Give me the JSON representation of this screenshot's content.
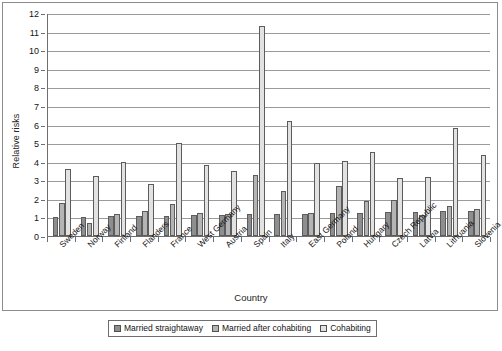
{
  "axes": {
    "ylabel": "Relative risks",
    "xlabel": "Country",
    "yticks": [
      "0",
      "1",
      "2",
      "3",
      "4",
      "5",
      "6",
      "7",
      "8",
      "9",
      "10",
      "11",
      "12"
    ]
  },
  "legend": {
    "items": [
      {
        "label": "Married straightaway",
        "color": "#8e8e8e"
      },
      {
        "label": "Married after cohabiting",
        "color": "#b4b4b4"
      },
      {
        "label": "Cohabiting",
        "color": "#e2e2e2"
      }
    ]
  },
  "chart_data": {
    "type": "bar",
    "title": "",
    "subtitle": "",
    "xlabel": "Country",
    "ylabel": "Relative risks",
    "ylim": [
      0,
      12
    ],
    "ytick_step": 1,
    "grid": true,
    "legend_position": "bottom",
    "categories": [
      "Sweden",
      "Norway",
      "Finland",
      "Flanders",
      "France",
      "West Germany",
      "Austria",
      "Spain",
      "Italy",
      "East Germany",
      "Poland",
      "Hungary",
      "Czech Republic",
      "Latvia",
      "Lithuania",
      "Slovenia"
    ],
    "series": [
      {
        "name": "Married straightaway",
        "color": "#8e8e8e",
        "values": [
          1.0,
          1.05,
          1.07,
          1.08,
          1.1,
          1.13,
          1.15,
          1.17,
          1.18,
          1.2,
          1.22,
          1.25,
          1.28,
          1.3,
          1.35,
          1.36
        ]
      },
      {
        "name": "Married after cohabiting",
        "color": "#b4b4b4",
        "values": [
          1.78,
          0.68,
          1.18,
          1.36,
          1.72,
          1.22,
          1.17,
          3.3,
          2.4,
          1.22,
          2.68,
          1.88,
          1.92,
          1.12,
          1.6,
          1.48
        ]
      },
      {
        "name": "Cohabiting",
        "color": "#e2e2e2",
        "values": [
          3.62,
          3.22,
          3.98,
          2.8,
          5.0,
          3.82,
          3.5,
          11.3,
          6.2,
          3.95,
          4.05,
          4.5,
          3.12,
          3.18,
          5.8,
          4.38
        ]
      }
    ]
  }
}
